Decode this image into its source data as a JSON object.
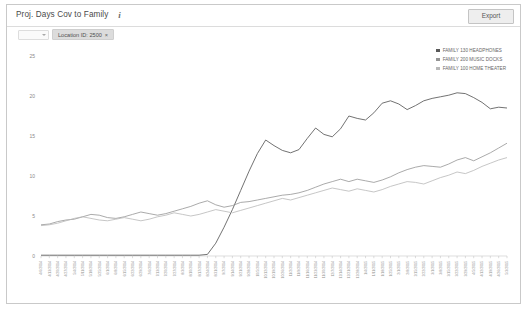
{
  "header": {
    "title": "Proj. Days Cov to Family",
    "info_icon": "i",
    "export_label": "Export"
  },
  "filters": {
    "select_placeholder": "",
    "chip_label": "Location ID: 2500",
    "chip_close": "×"
  },
  "legend": {
    "position": "top-right",
    "items": [
      {
        "label": "FAMILY 130 HEADPHONES",
        "color": "#595959"
      },
      {
        "label": "FAMILY 200 MUSIC DOCKS",
        "color": "#949494"
      },
      {
        "label": "FAMILY 100 HOME THEATER",
        "color": "#b8b8b8"
      }
    ]
  },
  "chart_data": {
    "type": "line",
    "title": "Proj. Days Cov to Family",
    "xlabel": "",
    "ylabel": "",
    "ylim": [
      0,
      25
    ],
    "yticks": [
      0,
      5,
      10,
      15,
      20,
      25
    ],
    "grid": false,
    "legend_position": "top-right",
    "x": [
      "4/6/2014",
      "4/13/2014",
      "4/20/2014",
      "4/27/2014",
      "5/4/2014",
      "5/11/2014",
      "5/18/2014",
      "5/25/2014",
      "6/1/2014",
      "6/8/2014",
      "6/15/2014",
      "6/22/2014",
      "6/29/2014",
      "7/6/2014",
      "7/13/2014",
      "7/20/2014",
      "7/27/2014",
      "8/3/2014",
      "8/10/2014",
      "8/17/2014",
      "8/24/2014",
      "8/31/2014",
      "9/7/2014",
      "9/14/2014",
      "9/21/2014",
      "9/28/2014",
      "10/5/2014",
      "10/12/2014",
      "10/19/2014",
      "10/26/2014",
      "11/2/2014",
      "11/9/2014",
      "11/16/2014",
      "11/23/2014",
      "11/30/2014",
      "12/7/2014",
      "12/14/2014",
      "12/21/2014",
      "12/28/2014",
      "1/4/2015",
      "1/11/2015",
      "1/18/2015",
      "1/25/2015",
      "2/1/2015",
      "2/8/2015",
      "2/15/2015",
      "2/22/2015",
      "3/1/2015",
      "3/8/2015",
      "3/15/2015",
      "3/22/2015",
      "3/29/2015",
      "4/5/2015",
      "4/12/2015",
      "4/19/2015",
      "4/26/2015",
      "5/3/2015"
    ],
    "series": [
      {
        "name": "FAMILY 130 HEADPHONES",
        "color": "#595959",
        "values": [
          0.1,
          0.1,
          0.1,
          0.1,
          0.1,
          0.1,
          0.1,
          0.1,
          0.1,
          0.1,
          0.1,
          0.1,
          0.1,
          0.1,
          0.1,
          0.1,
          0.1,
          0.1,
          0.1,
          0.1,
          0.2,
          1.6,
          3.6,
          5.8,
          8.2,
          10.6,
          12.8,
          14.5,
          13.8,
          13.2,
          12.9,
          13.3,
          14.7,
          16.0,
          15.2,
          14.9,
          15.9,
          17.5,
          17.2,
          17.0,
          17.9,
          19.1,
          19.4,
          19.0,
          18.3,
          18.8,
          19.4,
          19.7,
          19.9,
          20.1,
          20.4,
          20.3,
          19.8,
          19.2,
          18.4,
          18.6,
          18.5
        ]
      },
      {
        "name": "FAMILY 200 MUSIC DOCKS",
        "color": "#949494",
        "values": [
          3.9,
          4.0,
          4.3,
          4.5,
          4.6,
          4.9,
          5.2,
          5.1,
          4.8,
          4.7,
          4.9,
          5.2,
          5.5,
          5.3,
          5.1,
          5.3,
          5.6,
          5.9,
          6.2,
          6.6,
          6.9,
          6.4,
          6.1,
          6.3,
          6.7,
          6.8,
          7.0,
          7.2,
          7.4,
          7.6,
          7.7,
          7.9,
          8.2,
          8.6,
          9.0,
          9.3,
          9.6,
          9.3,
          9.6,
          9.4,
          9.2,
          9.5,
          9.9,
          10.4,
          10.8,
          11.1,
          11.3,
          11.2,
          11.1,
          11.5,
          12.0,
          12.3,
          11.9,
          12.4,
          12.9,
          13.5,
          14.1
        ]
      },
      {
        "name": "FAMILY 100 HOME THEATER",
        "color": "#b8b8b8",
        "values": [
          3.8,
          3.9,
          4.1,
          4.4,
          4.7,
          4.9,
          4.7,
          4.5,
          4.4,
          4.6,
          4.8,
          4.6,
          4.4,
          4.6,
          4.9,
          5.1,
          5.4,
          5.2,
          5.0,
          5.2,
          5.5,
          5.8,
          5.6,
          5.4,
          5.7,
          6.0,
          6.3,
          6.6,
          6.9,
          7.2,
          7.0,
          7.3,
          7.6,
          7.9,
          8.2,
          8.5,
          8.3,
          8.1,
          8.4,
          8.2,
          8.0,
          8.3,
          8.7,
          9.0,
          9.3,
          9.2,
          9.0,
          9.4,
          9.8,
          10.1,
          10.5,
          10.3,
          10.7,
          11.2,
          11.6,
          12.0,
          12.3
        ]
      }
    ]
  }
}
